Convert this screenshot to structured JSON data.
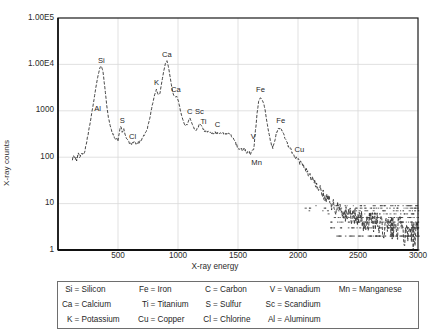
{
  "chart_data": {
    "type": "line",
    "title": "",
    "subtitle": "",
    "xlabel": "X-ray energy",
    "ylabel": "X-ray counts",
    "xlim": [
      0,
      3000
    ],
    "ylim": [
      1,
      100000
    ],
    "yscale": "log",
    "grid": true,
    "legend_position": "below-plot",
    "x_ticks": [
      "500",
      "1000",
      "1500",
      "2000",
      "2500",
      "3000"
    ],
    "x_tick_values": [
      500,
      1000,
      1500,
      2000,
      2500,
      3000
    ],
    "y_ticks": [
      "1.00E5",
      "1.00E4",
      "1000",
      "100",
      "10",
      "1"
    ],
    "y_tick_values": [
      100000,
      10000,
      1000,
      100,
      10,
      1
    ],
    "series": [
      {
        "name": "X-ray spectrum",
        "style": "dashed-line",
        "color": "#333333",
        "points": [
          [
            120,
            95
          ],
          [
            140,
            105
          ],
          [
            155,
            88
          ],
          [
            170,
            120
          ],
          [
            185,
            100
          ],
          [
            200,
            130
          ],
          [
            215,
            115
          ],
          [
            230,
            160
          ],
          [
            250,
            300
          ],
          [
            270,
            600
          ],
          [
            290,
            1200
          ],
          [
            310,
            2600
          ],
          [
            330,
            5200
          ],
          [
            350,
            8600
          ],
          [
            362,
            9200
          ],
          [
            375,
            7000
          ],
          [
            390,
            3200
          ],
          [
            405,
            1400
          ],
          [
            420,
            700
          ],
          [
            440,
            420
          ],
          [
            460,
            300
          ],
          [
            480,
            250
          ],
          [
            500,
            230
          ],
          [
            515,
            400
          ],
          [
            525,
            470
          ],
          [
            535,
            330
          ],
          [
            548,
            430
          ],
          [
            558,
            330
          ],
          [
            575,
            240
          ],
          [
            595,
            205
          ],
          [
            615,
            200
          ],
          [
            635,
            215
          ],
          [
            655,
            200
          ],
          [
            675,
            210
          ],
          [
            700,
            240
          ],
          [
            720,
            300
          ],
          [
            745,
            420
          ],
          [
            765,
            700
          ],
          [
            785,
            1300
          ],
          [
            805,
            2200
          ],
          [
            820,
            2900
          ],
          [
            835,
            2200
          ],
          [
            850,
            2400
          ],
          [
            865,
            4200
          ],
          [
            880,
            7000
          ],
          [
            895,
            10500
          ],
          [
            908,
            12000
          ],
          [
            920,
            9000
          ],
          [
            935,
            5200
          ],
          [
            950,
            3000
          ],
          [
            965,
            2100
          ],
          [
            978,
            2000
          ],
          [
            990,
            2050
          ],
          [
            1005,
            1600
          ],
          [
            1020,
            1000
          ],
          [
            1040,
            640
          ],
          [
            1060,
            460
          ],
          [
            1080,
            520
          ],
          [
            1095,
            700
          ],
          [
            1110,
            620
          ],
          [
            1130,
            430
          ],
          [
            1150,
            370
          ],
          [
            1165,
            430
          ],
          [
            1180,
            520
          ],
          [
            1195,
            470
          ],
          [
            1215,
            380
          ],
          [
            1235,
            350
          ],
          [
            1250,
            370
          ],
          [
            1270,
            340
          ],
          [
            1290,
            330
          ],
          [
            1310,
            345
          ],
          [
            1330,
            330
          ],
          [
            1350,
            340
          ],
          [
            1370,
            330
          ],
          [
            1390,
            320
          ],
          [
            1410,
            325
          ],
          [
            1425,
            310
          ],
          [
            1440,
            300
          ],
          [
            1460,
            250
          ],
          [
            1480,
            200
          ],
          [
            1495,
            165
          ],
          [
            1510,
            140
          ],
          [
            1525,
            160
          ],
          [
            1540,
            135
          ],
          [
            1555,
            150
          ],
          [
            1570,
            120
          ],
          [
            1585,
            135
          ],
          [
            1600,
            118
          ],
          [
            1615,
            130
          ],
          [
            1630,
            140
          ],
          [
            1645,
            360
          ],
          [
            1660,
            900
          ],
          [
            1672,
            1600
          ],
          [
            1685,
            1900
          ],
          [
            1700,
            1750
          ],
          [
            1715,
            1450
          ],
          [
            1730,
            900
          ],
          [
            1745,
            500
          ],
          [
            1760,
            310
          ],
          [
            1775,
            200
          ],
          [
            1790,
            165
          ],
          [
            1805,
            220
          ],
          [
            1820,
            330
          ],
          [
            1835,
            400
          ],
          [
            1850,
            420
          ],
          [
            1862,
            400
          ],
          [
            1875,
            350
          ],
          [
            1890,
            270
          ],
          [
            1905,
            210
          ],
          [
            1920,
            175
          ],
          [
            1935,
            150
          ],
          [
            1950,
            130
          ],
          [
            1965,
            115
          ],
          [
            1980,
            100
          ],
          [
            1995,
            92
          ],
          [
            2010,
            80
          ],
          [
            2025,
            72
          ],
          [
            2040,
            66
          ],
          [
            2055,
            58
          ],
          [
            2070,
            52
          ],
          [
            2085,
            46
          ],
          [
            2100,
            40
          ],
          [
            2115,
            36
          ],
          [
            2130,
            32
          ],
          [
            2145,
            28
          ],
          [
            2160,
            25
          ],
          [
            2175,
            22
          ],
          [
            2190,
            19
          ],
          [
            2205,
            17
          ],
          [
            2220,
            15
          ],
          [
            2235,
            13
          ],
          [
            2250,
            12
          ],
          [
            2265,
            11
          ],
          [
            2280,
            10
          ],
          [
            2300,
            9
          ],
          [
            2320,
            8
          ],
          [
            2340,
            8
          ],
          [
            2360,
            7
          ],
          [
            2380,
            7
          ],
          [
            2400,
            6
          ],
          [
            2430,
            6
          ],
          [
            2460,
            5
          ],
          [
            2490,
            5
          ],
          [
            2520,
            5
          ],
          [
            2550,
            4
          ],
          [
            2600,
            4
          ],
          [
            2650,
            4
          ],
          [
            2700,
            3
          ],
          [
            2750,
            3
          ],
          [
            2800,
            3
          ],
          [
            2850,
            3
          ],
          [
            2900,
            2
          ],
          [
            2950,
            2
          ],
          [
            3000,
            2
          ]
        ]
      }
    ],
    "annotations": [
      {
        "label": "Al",
        "x": 330,
        "y": 1050,
        "element": "Aluminum"
      },
      {
        "label": "Si",
        "x": 362,
        "y": 11500,
        "element": "Silicon"
      },
      {
        "label": "S",
        "x": 535,
        "y": 560,
        "element": "Sulfur"
      },
      {
        "label": "Cl",
        "x": 622,
        "y": 265,
        "element": "Chlorine"
      },
      {
        "label": "K",
        "x": 822,
        "y": 3700,
        "element": "Potassium"
      },
      {
        "label": "Ca",
        "x": 908,
        "y": 15500,
        "element": "Calcium"
      },
      {
        "label": "Ca",
        "x": 982,
        "y": 2700,
        "element": "Calcium"
      },
      {
        "label": "C",
        "x": 1098,
        "y": 900,
        "element": "Carbon"
      },
      {
        "label": "Sc",
        "x": 1178,
        "y": 900,
        "element": "Scandium"
      },
      {
        "label": "Ti",
        "x": 1212,
        "y": 540,
        "element": "Titanium"
      },
      {
        "label": "C",
        "x": 1330,
        "y": 460,
        "element": "Carbon"
      },
      {
        "label": "V",
        "x": 1628,
        "y": 260,
        "element": "Vanadium"
      },
      {
        "label": "Mn",
        "x": 1655,
        "y": 72,
        "element": "Manganese"
      },
      {
        "label": "Fe",
        "x": 1688,
        "y": 2650,
        "element": "Iron"
      },
      {
        "label": "Fe",
        "x": 1856,
        "y": 560,
        "element": "Iron"
      },
      {
        "label": "Cu",
        "x": 2012,
        "y": 135,
        "element": "Copper"
      }
    ]
  },
  "axes": {
    "y_label": "X-ray counts",
    "x_label": "X-ray energy",
    "y_ticks": [
      "1.00E5",
      "1.00E4",
      "1000",
      "100",
      "10",
      "1"
    ],
    "x_ticks": [
      "500",
      "1000",
      "1500",
      "2000",
      "2500",
      "3000"
    ]
  },
  "legend": {
    "rows": [
      [
        {
          "symbol": "Si",
          "eq": "=",
          "name": "Silicon"
        },
        {
          "symbol": "Fe",
          "eq": "=",
          "name": "Iron"
        },
        {
          "symbol": "C",
          "eq": "=",
          "name": "Carbon"
        },
        {
          "symbol": "V",
          "eq": "=",
          "name": "Vanadium"
        },
        {
          "symbol": "Mn",
          "eq": "=",
          "name": "Manganese"
        }
      ],
      [
        {
          "symbol": "Ca",
          "eq": "=",
          "name": "Calcium"
        },
        {
          "symbol": "Ti",
          "eq": "=",
          "name": "Titanium"
        },
        {
          "symbol": "S",
          "eq": "=",
          "name": "Sulfur"
        },
        {
          "symbol": "Sc",
          "eq": "=",
          "name": "Scandium"
        },
        {
          "symbol": "",
          "eq": "",
          "name": ""
        }
      ],
      [
        {
          "symbol": "K",
          "eq": "=",
          "name": "Potassium"
        },
        {
          "symbol": "Cu",
          "eq": "=",
          "name": "Copper"
        },
        {
          "symbol": "Cl",
          "eq": "=",
          "name": "Chlorine"
        },
        {
          "symbol": "Al",
          "eq": "=",
          "name": "Aluminum"
        },
        {
          "symbol": "",
          "eq": "",
          "name": ""
        }
      ]
    ]
  },
  "style": {
    "line_color": "#333333",
    "grid_color": "#d9d9d9",
    "frame_color": "#1a1a1a",
    "text_color": "#1f1f1f",
    "background": "#ffffff"
  }
}
